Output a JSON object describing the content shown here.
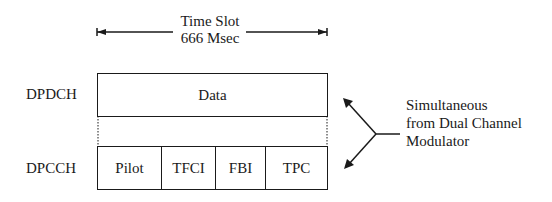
{
  "time_slot": {
    "label_line1": "Time Slot",
    "label_line2": "666 Msec"
  },
  "channels": {
    "dpdch": {
      "name": "DPDCH",
      "fields": [
        "Data"
      ]
    },
    "dpcch": {
      "name": "DPCCH",
      "fields": [
        "Pilot",
        "TFCI",
        "FBI",
        "TPC"
      ]
    }
  },
  "annotation": {
    "line1": "Simultaneous",
    "line2": "from Dual Channel",
    "line3": "Modulator"
  },
  "colors": {
    "stroke": "#1a1a1a",
    "background": "#ffffff"
  }
}
